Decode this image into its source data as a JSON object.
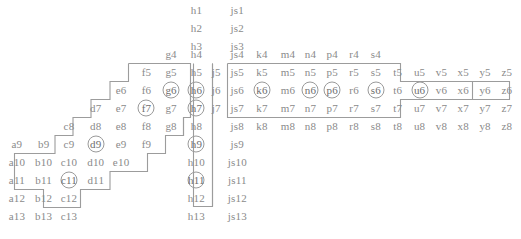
{
  "figure": {
    "type": "cell-grid-diagram",
    "text_color": "#8a8a8a",
    "border_color": "#9a9a9a",
    "background": "#ffffff"
  },
  "columns": [
    {
      "key": "a",
      "x": 24
    },
    {
      "key": "b",
      "x": 62
    },
    {
      "key": "c",
      "x": 98
    },
    {
      "key": "d",
      "x": 136
    },
    {
      "key": "e",
      "x": 172
    },
    {
      "key": "f",
      "x": 208
    },
    {
      "key": "g",
      "x": 243
    },
    {
      "key": "h",
      "x": 279
    },
    {
      "key": "j",
      "x": 307
    },
    {
      "key": "js",
      "x": 337
    },
    {
      "key": "k",
      "x": 372
    },
    {
      "key": "m",
      "x": 409
    },
    {
      "key": "n",
      "x": 441
    },
    {
      "key": "p",
      "x": 472
    },
    {
      "key": "r",
      "x": 503
    },
    {
      "key": "s",
      "x": 534
    },
    {
      "key": "t",
      "x": 565
    },
    {
      "key": "u",
      "x": 596
    },
    {
      "key": "v",
      "x": 627
    },
    {
      "key": "x",
      "x": 658
    },
    {
      "key": "y",
      "x": 689
    },
    {
      "key": "z",
      "x": 720
    }
  ],
  "rows": [
    {
      "n": 1,
      "y": 10
    },
    {
      "n": 2,
      "y": 28
    },
    {
      "n": 3,
      "y": 46
    },
    {
      "n": 4,
      "y": 54
    },
    {
      "n": 5,
      "y": 72
    },
    {
      "n": 6,
      "y": 90
    },
    {
      "n": 7,
      "y": 108
    },
    {
      "n": 8,
      "y": 126
    },
    {
      "n": 9,
      "y": 144
    },
    {
      "n": 10,
      "y": 162
    },
    {
      "n": 11,
      "y": 180
    },
    {
      "n": 12,
      "y": 198
    },
    {
      "n": 13,
      "y": 216
    }
  ],
  "cells": [
    {
      "label": "h1",
      "col": "h",
      "row": 1,
      "circled": false
    },
    {
      "label": "js1",
      "col": "js",
      "row": 1,
      "circled": false
    },
    {
      "label": "h2",
      "col": "h",
      "row": 2,
      "circled": false
    },
    {
      "label": "js2",
      "col": "js",
      "row": 2,
      "circled": false
    },
    {
      "label": "h3",
      "col": "h",
      "row": 3,
      "circled": false
    },
    {
      "label": "js3",
      "col": "js",
      "row": 3,
      "circled": false
    },
    {
      "label": "g4",
      "col": "g",
      "row": 4,
      "circled": false
    },
    {
      "label": "h4",
      "col": "h",
      "row": 4,
      "circled": false
    },
    {
      "label": "js4",
      "col": "js",
      "row": 4,
      "circled": false
    },
    {
      "label": "k4",
      "col": "k",
      "row": 4,
      "circled": false
    },
    {
      "label": "m4",
      "col": "m",
      "row": 4,
      "circled": false
    },
    {
      "label": "n4",
      "col": "n",
      "row": 4,
      "circled": false
    },
    {
      "label": "p4",
      "col": "p",
      "row": 4,
      "circled": false
    },
    {
      "label": "r4",
      "col": "r",
      "row": 4,
      "circled": false
    },
    {
      "label": "s4",
      "col": "s",
      "row": 4,
      "circled": false
    },
    {
      "label": "f5",
      "col": "f",
      "row": 5,
      "circled": false
    },
    {
      "label": "g5",
      "col": "g",
      "row": 5,
      "circled": false
    },
    {
      "label": "h5",
      "col": "h",
      "row": 5,
      "circled": false
    },
    {
      "label": "j5",
      "col": "j",
      "row": 5,
      "circled": false
    },
    {
      "label": "js5",
      "col": "js",
      "row": 5,
      "circled": false
    },
    {
      "label": "k5",
      "col": "k",
      "row": 5,
      "circled": false
    },
    {
      "label": "m5",
      "col": "m",
      "row": 5,
      "circled": false
    },
    {
      "label": "n5",
      "col": "n",
      "row": 5,
      "circled": false
    },
    {
      "label": "p5",
      "col": "p",
      "row": 5,
      "circled": false
    },
    {
      "label": "r5",
      "col": "r",
      "row": 5,
      "circled": false
    },
    {
      "label": "s5",
      "col": "s",
      "row": 5,
      "circled": false
    },
    {
      "label": "t5",
      "col": "t",
      "row": 5,
      "circled": false
    },
    {
      "label": "u5",
      "col": "u",
      "row": 5,
      "circled": false
    },
    {
      "label": "v5",
      "col": "v",
      "row": 5,
      "circled": false
    },
    {
      "label": "x5",
      "col": "x",
      "row": 5,
      "circled": false
    },
    {
      "label": "y5",
      "col": "y",
      "row": 5,
      "circled": false
    },
    {
      "label": "z5",
      "col": "z",
      "row": 5,
      "circled": false
    },
    {
      "label": "e6",
      "col": "e",
      "row": 6,
      "circled": false
    },
    {
      "label": "f6",
      "col": "f",
      "row": 6,
      "circled": false
    },
    {
      "label": "g6",
      "col": "g",
      "row": 6,
      "circled": true
    },
    {
      "label": "h6",
      "col": "h",
      "row": 6,
      "circled": true
    },
    {
      "label": "j6",
      "col": "j",
      "row": 6,
      "circled": false
    },
    {
      "label": "js6",
      "col": "js",
      "row": 6,
      "circled": false
    },
    {
      "label": "k6",
      "col": "k",
      "row": 6,
      "circled": true
    },
    {
      "label": "m6",
      "col": "m",
      "row": 6,
      "circled": false
    },
    {
      "label": "n6",
      "col": "n",
      "row": 6,
      "circled": true
    },
    {
      "label": "p6",
      "col": "p",
      "row": 6,
      "circled": true
    },
    {
      "label": "r6",
      "col": "r",
      "row": 6,
      "circled": false
    },
    {
      "label": "s6",
      "col": "s",
      "row": 6,
      "circled": true
    },
    {
      "label": "t6",
      "col": "t",
      "row": 6,
      "circled": false
    },
    {
      "label": "u6",
      "col": "u",
      "row": 6,
      "circled": true
    },
    {
      "label": "v6",
      "col": "v",
      "row": 6,
      "circled": false
    },
    {
      "label": "x6",
      "col": "x",
      "row": 6,
      "circled": false
    },
    {
      "label": "y6",
      "col": "y",
      "row": 6,
      "circled": false
    },
    {
      "label": "z6",
      "col": "z",
      "row": 6,
      "circled": false
    },
    {
      "label": "d7",
      "col": "d",
      "row": 7,
      "circled": false
    },
    {
      "label": "e7",
      "col": "e",
      "row": 7,
      "circled": false
    },
    {
      "label": "f7",
      "col": "f",
      "row": 7,
      "circled": true
    },
    {
      "label": "g7",
      "col": "g",
      "row": 7,
      "circled": false
    },
    {
      "label": "h7",
      "col": "h",
      "row": 7,
      "circled": true
    },
    {
      "label": "j7",
      "col": "j",
      "row": 7,
      "circled": false
    },
    {
      "label": "js7",
      "col": "js",
      "row": 7,
      "circled": false
    },
    {
      "label": "k7",
      "col": "k",
      "row": 7,
      "circled": false
    },
    {
      "label": "m7",
      "col": "m",
      "row": 7,
      "circled": false
    },
    {
      "label": "n7",
      "col": "n",
      "row": 7,
      "circled": false
    },
    {
      "label": "p7",
      "col": "p",
      "row": 7,
      "circled": false
    },
    {
      "label": "r7",
      "col": "r",
      "row": 7,
      "circled": false
    },
    {
      "label": "s7",
      "col": "s",
      "row": 7,
      "circled": false
    },
    {
      "label": "t7",
      "col": "t",
      "row": 7,
      "circled": false
    },
    {
      "label": "u7",
      "col": "u",
      "row": 7,
      "circled": false
    },
    {
      "label": "v7",
      "col": "v",
      "row": 7,
      "circled": false
    },
    {
      "label": "x7",
      "col": "x",
      "row": 7,
      "circled": false
    },
    {
      "label": "y7",
      "col": "y",
      "row": 7,
      "circled": false
    },
    {
      "label": "z7",
      "col": "z",
      "row": 7,
      "circled": false
    },
    {
      "label": "c8",
      "col": "c",
      "row": 8,
      "circled": false
    },
    {
      "label": "d8",
      "col": "d",
      "row": 8,
      "circled": false
    },
    {
      "label": "e8",
      "col": "e",
      "row": 8,
      "circled": false
    },
    {
      "label": "f8",
      "col": "f",
      "row": 8,
      "circled": false
    },
    {
      "label": "g8",
      "col": "g",
      "row": 8,
      "circled": false
    },
    {
      "label": "h8",
      "col": "h",
      "row": 8,
      "circled": false
    },
    {
      "label": "js8",
      "col": "js",
      "row": 8,
      "circled": false
    },
    {
      "label": "k8",
      "col": "k",
      "row": 8,
      "circled": false
    },
    {
      "label": "m8",
      "col": "m",
      "row": 8,
      "circled": false
    },
    {
      "label": "n8",
      "col": "n",
      "row": 8,
      "circled": false
    },
    {
      "label": "p8",
      "col": "p",
      "row": 8,
      "circled": false
    },
    {
      "label": "r8",
      "col": "r",
      "row": 8,
      "circled": false
    },
    {
      "label": "s8",
      "col": "s",
      "row": 8,
      "circled": false
    },
    {
      "label": "t8",
      "col": "t",
      "row": 8,
      "circled": false
    },
    {
      "label": "u8",
      "col": "u",
      "row": 8,
      "circled": false
    },
    {
      "label": "v8",
      "col": "v",
      "row": 8,
      "circled": false
    },
    {
      "label": "x8",
      "col": "x",
      "row": 8,
      "circled": false
    },
    {
      "label": "y8",
      "col": "y",
      "row": 8,
      "circled": false
    },
    {
      "label": "z8",
      "col": "z",
      "row": 8,
      "circled": false
    },
    {
      "label": "a9",
      "col": "a",
      "row": 9,
      "circled": false
    },
    {
      "label": "b9",
      "col": "b",
      "row": 9,
      "circled": false
    },
    {
      "label": "c9",
      "col": "c",
      "row": 9,
      "circled": false
    },
    {
      "label": "d9",
      "col": "d",
      "row": 9,
      "circled": true
    },
    {
      "label": "e9",
      "col": "e",
      "row": 9,
      "circled": false
    },
    {
      "label": "f9",
      "col": "f",
      "row": 9,
      "circled": false
    },
    {
      "label": "h9",
      "col": "h",
      "row": 9,
      "circled": true
    },
    {
      "label": "js9",
      "col": "js",
      "row": 9,
      "circled": false
    },
    {
      "label": "a10",
      "col": "a",
      "row": 10,
      "circled": false
    },
    {
      "label": "b10",
      "col": "b",
      "row": 10,
      "circled": false
    },
    {
      "label": "c10",
      "col": "c",
      "row": 10,
      "circled": false
    },
    {
      "label": "d10",
      "col": "d",
      "row": 10,
      "circled": false
    },
    {
      "label": "e10",
      "col": "e",
      "row": 10,
      "circled": false
    },
    {
      "label": "h10",
      "col": "h",
      "row": 10,
      "circled": false
    },
    {
      "label": "js10",
      "col": "js",
      "row": 10,
      "circled": false
    },
    {
      "label": "a11",
      "col": "a",
      "row": 11,
      "circled": false
    },
    {
      "label": "b11",
      "col": "b",
      "row": 11,
      "circled": false
    },
    {
      "label": "c11",
      "col": "c",
      "row": 11,
      "circled": true
    },
    {
      "label": "d11",
      "col": "d",
      "row": 11,
      "circled": false
    },
    {
      "label": "h11",
      "col": "h",
      "row": 11,
      "circled": true
    },
    {
      "label": "js11",
      "col": "js",
      "row": 11,
      "circled": false
    },
    {
      "label": "a12",
      "col": "a",
      "row": 12,
      "circled": false
    },
    {
      "label": "b12",
      "col": "b",
      "row": 12,
      "circled": false
    },
    {
      "label": "c12",
      "col": "c",
      "row": 12,
      "circled": false
    },
    {
      "label": "h12",
      "col": "h",
      "row": 12,
      "circled": false
    },
    {
      "label": "js12",
      "col": "js",
      "row": 12,
      "circled": false
    },
    {
      "label": "a13",
      "col": "a",
      "row": 13,
      "circled": false
    },
    {
      "label": "b13",
      "col": "b",
      "row": 13,
      "circled": false
    },
    {
      "label": "c13",
      "col": "c",
      "row": 13,
      "circled": false
    },
    {
      "label": "h13",
      "col": "h",
      "row": 13,
      "circled": false
    },
    {
      "label": "js13",
      "col": "js",
      "row": 13,
      "circled": false
    }
  ],
  "outlines": [
    {
      "name": "left-staircase-region",
      "points": "129,63 191,63 191,117 157,117 157,135 120,135 120,153 83,153 83,171 14,171 14,207 43,207 43,189 80,189 80,171 120,171 120,153 157,153 157,135 191,135 191,99 209,99 209,63"
    },
    {
      "name": "left-staircase-outline",
      "path": "M129,63 L191,63 L191,99 L209,99 L209,117 M129,63 L129,81 L111,81 L111,99 L92,99 L92,117 L74,117 L74,135 L56,135 L56,153 L14,153 L14,189 L43,189 L43,207 L80,207 L80,189 L110,189 L110,171 L147,171 L147,153 L165,153 L165,135 L183,135"
    },
    {
      "name": "h-column-region",
      "path": "M188,63 L188,206 L212,206 L212,63"
    },
    {
      "name": "right-region",
      "path": "M228,63 L400,63 L400,81 L472,81 L472,117 L400,117 L400,81 M228,63 L228,117"
    }
  ],
  "circled_cells": [
    "g6",
    "h6",
    "k6",
    "n6",
    "p6",
    "s6",
    "u6",
    "f7",
    "h7",
    "d9",
    "h9",
    "c11",
    "h11"
  ]
}
